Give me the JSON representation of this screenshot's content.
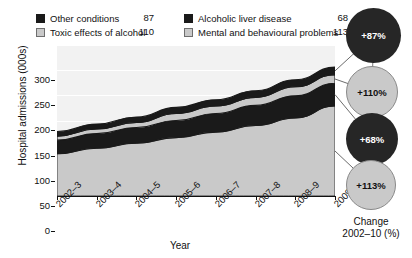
{
  "chart_data": {
    "type": "area",
    "title": "",
    "xlabel": "Year",
    "ylabel": "Hospital admissions (000s)",
    "ylim": [
      0,
      300
    ],
    "yticks": [
      0,
      50,
      100,
      150,
      200,
      250,
      300
    ],
    "grid": true,
    "stacked": true,
    "legend_position": "top",
    "categories": [
      "2002–3",
      "2003–4",
      "2004–5",
      "2005–6",
      "2006–7",
      "2007–8",
      "2008–9",
      "2009–10"
    ],
    "series": [
      {
        "name": "Mental and behavioural problems",
        "final_value": 113,
        "change_pct": "+113%",
        "color": "#c9c9c9",
        "swatch": "light",
        "values": [
          84,
          95,
          105,
          116,
          127,
          140,
          155,
          179
        ]
      },
      {
        "name": "Alcoholic liver disease",
        "final_value": 68,
        "change_pct": "+68%",
        "color": "#1a1a1a",
        "swatch": "dark",
        "values": [
          27,
          29,
          31,
          34,
          37,
          40,
          44,
          45
        ]
      },
      {
        "name": "Toxic effects of alcohol",
        "final_value": 110,
        "change_pct": "+110%",
        "color": "#c9c9c9",
        "swatch": "light",
        "values": [
          8,
          9,
          10,
          14,
          15,
          16,
          18,
          17
        ]
      },
      {
        "name": "Other conditions",
        "final_value": 87,
        "change_pct": "+87%",
        "color": "#1a1a1a",
        "swatch": "dark",
        "values": [
          9,
          10,
          11,
          12,
          12,
          13,
          14,
          15
        ]
      }
    ],
    "totals": [
      128,
      143,
      157,
      176,
      191,
      209,
      231,
      256
    ],
    "change_caption_line1": "Change",
    "change_caption_line2": "2002–10 (%)"
  },
  "legend": {
    "rows": [
      {
        "left": {
          "swatch": "dark",
          "label": "Other conditions",
          "value": "87"
        },
        "right": {
          "swatch": "dark",
          "label": "Alcoholic liver disease",
          "value": "68"
        }
      },
      {
        "left": {
          "swatch": "light",
          "label": "Toxic effects of alcohol",
          "value": "110"
        },
        "right": {
          "swatch": "light",
          "label": "Mental and behavioural problems",
          "value": "113"
        }
      }
    ]
  },
  "axes": {
    "y": {
      "title": "Hospital admissions (000s)",
      "ticks": [
        "300",
        "250",
        "200",
        "150",
        "100",
        "50",
        "0"
      ]
    },
    "x": {
      "title": "Year",
      "ticks": [
        "2002–3",
        "2003–4",
        "2004–5",
        "2005–6",
        "2006–7",
        "2007–8",
        "2008–9",
        "2009–10"
      ]
    }
  },
  "change_panel": {
    "caption_line1": "Change",
    "caption_line2": "2002–10 (%)",
    "circles": [
      {
        "value": "+87%",
        "tone": "dark"
      },
      {
        "value": "+110%",
        "tone": "light"
      },
      {
        "value": "+68%",
        "tone": "dark"
      },
      {
        "value": "+113%",
        "tone": "light"
      }
    ]
  }
}
